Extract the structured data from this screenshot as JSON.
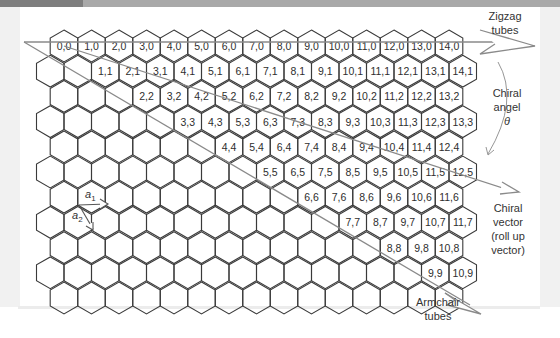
{
  "header": {
    "caption_fragment": "...ollapse roll up vector ... ally the lattice."
  },
  "diagram": {
    "lattice": {
      "origin_x": 64,
      "origin_y": 46,
      "hex_width": 27.5,
      "row_height": 25.2,
      "hex_side": 15.9,
      "rows": [
        {
          "m": 0,
          "n_from": 0,
          "n_to": 14
        },
        {
          "m": 1,
          "n_from": -1,
          "n_to": 14
        },
        {
          "m": 2,
          "n_from": -1,
          "n_to": 13
        },
        {
          "m": 3,
          "n_from": -2,
          "n_to": 13
        },
        {
          "m": 4,
          "n_from": -2,
          "n_to": 12
        },
        {
          "m": 5,
          "n_from": -3,
          "n_to": 12
        },
        {
          "m": 6,
          "n_from": -3,
          "n_to": 11
        },
        {
          "m": 7,
          "n_from": -4,
          "n_to": 11
        },
        {
          "m": 8,
          "n_from": -4,
          "n_to": 10
        },
        {
          "m": 9,
          "n_from": -5,
          "n_to": 10
        },
        {
          "m": 10,
          "n_from": -5,
          "n_to": 9
        }
      ]
    },
    "cell_labels": [
      [
        "0,0",
        "1,0",
        "2,0",
        "3,0",
        "4,0",
        "5,0",
        "6,0",
        "7,0",
        "8,0",
        "9,0",
        "10,0",
        "11,0",
        "12,0",
        "13,0",
        "14,0"
      ],
      [
        "1,1",
        "2,1",
        "3,1",
        "4,1",
        "5,1",
        "6,1",
        "7,1",
        "8,1",
        "9,1",
        "10,1",
        "11,1",
        "12,1",
        "13,1",
        "14,1"
      ],
      [
        "2,2",
        "3,2",
        "4,2",
        "5,2",
        "6,2",
        "7,2",
        "8,2",
        "9,2",
        "10,2",
        "11,2",
        "12,2",
        "13,2"
      ],
      [
        "3,3",
        "4,3",
        "5,3",
        "6,3",
        "7,3",
        "8,3",
        "9,3",
        "10,3",
        "11,3",
        "12,3",
        "13,3"
      ],
      [
        "4,4",
        "5,4",
        "6,4",
        "7,4",
        "8,4",
        "9,4",
        "10,4",
        "11,4",
        "12,4"
      ],
      [
        "5,5",
        "6,5",
        "7,5",
        "8,5",
        "9,5",
        "10,5",
        "11,5",
        "12,5"
      ],
      [
        "6,6",
        "7,6",
        "8,6",
        "9,6",
        "10,6",
        "11,6"
      ],
      [
        "7,7",
        "8,7",
        "9,7",
        "10,7",
        "11,7"
      ],
      [
        "8,8",
        "9,8",
        "10,8"
      ],
      [
        "9,9",
        "10,9"
      ]
    ],
    "annotations": {
      "zigzag": [
        "Zigzag",
        "tubes"
      ],
      "chiral_angle": [
        "Chiral",
        "angel",
        "θ"
      ],
      "chiral_vector": [
        "Chiral",
        "vector",
        "(roll up",
        "vector)"
      ],
      "armchair": [
        "Armchair",
        "tubes"
      ],
      "a1": "a",
      "a1_sub": "1",
      "a2": "a",
      "a2_sub": "2"
    },
    "colors": {
      "hex_stroke": "#3a3a3a",
      "arrow_stroke": "#8a8a8a",
      "text": "#2e2e2e"
    }
  }
}
